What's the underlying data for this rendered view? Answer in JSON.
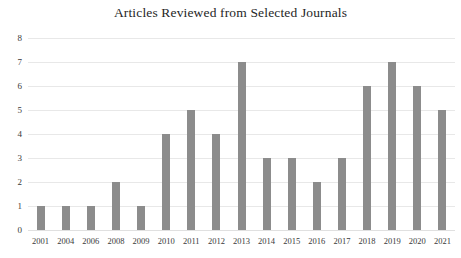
{
  "chart_data": {
    "type": "bar",
    "title": "Articles Reviewed from Selected Journals",
    "xlabel": "",
    "ylabel": "",
    "categories": [
      "2001",
      "2004",
      "2006",
      "2008",
      "2009",
      "2010",
      "2011",
      "2012",
      "2013",
      "2014",
      "2015",
      "2016",
      "2017",
      "2018",
      "2019",
      "2020",
      "2021"
    ],
    "values": [
      1,
      1,
      1,
      2,
      1,
      4,
      5,
      4,
      7,
      3,
      3,
      2,
      3,
      6,
      7,
      6,
      5
    ],
    "ylim": [
      0,
      8
    ],
    "yticks": [
      0,
      1,
      2,
      3,
      4,
      5,
      6,
      7,
      8
    ],
    "ytick_labels": [
      "0",
      "1",
      "2",
      "3",
      "4",
      "5",
      "6",
      "7",
      "8"
    ],
    "grid": true,
    "legend": false,
    "bar_color": "#8c8c8c",
    "grid_color": "#e8e8e8",
    "background_color": "#ffffff",
    "title_color": "#262626"
  }
}
